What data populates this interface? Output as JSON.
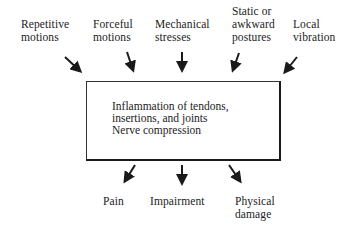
{
  "diagram": {
    "inputs": [
      {
        "line1": "Repetitive",
        "line2": "motions"
      },
      {
        "line1": "Forceful",
        "line2": "motions"
      },
      {
        "line1": "Mechanical",
        "line2": "stresses"
      },
      {
        "line1": "Static or",
        "line2": "awkward",
        "line3": "postures"
      },
      {
        "line1": "Local",
        "line2": "vibration"
      }
    ],
    "center": {
      "line1": "Inflammation of tendons,",
      "line2": "insertions, and joints",
      "line3": "Nerve compression"
    },
    "outputs": [
      {
        "line1": "Pain"
      },
      {
        "line1": "Impairment"
      },
      {
        "line1": "Physical",
        "line2": "damage"
      }
    ],
    "colors": {
      "ink": "#1a1a1a",
      "background": "#ffffff"
    }
  }
}
